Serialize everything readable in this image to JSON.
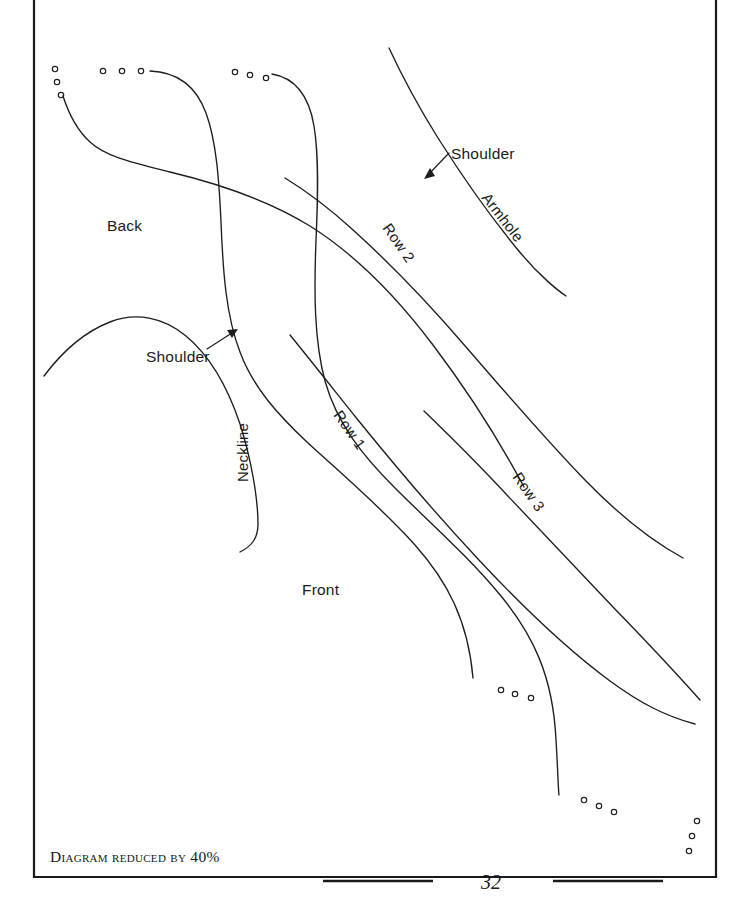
{
  "page": {
    "number": "32",
    "caption": "Diagram reduced by 40%",
    "width": 741,
    "height": 912,
    "background_color": "#ffffff",
    "ink_color": "#1d1d1d",
    "frame": {
      "x": 33,
      "y": -4,
      "width": 684,
      "height": 881,
      "stroke_color": "#1a1a1a"
    }
  },
  "diagram": {
    "title_labels": {
      "back": "Back",
      "front": "Front"
    },
    "annotations": [
      {
        "id": "shoulder-back",
        "text": "Shoulder",
        "x": 146,
        "y": 362,
        "rotation": 0
      },
      {
        "id": "shoulder-front",
        "text": "Shoulder",
        "x": 451,
        "y": 159,
        "rotation": 0
      },
      {
        "id": "neckline",
        "text": "Neckline",
        "x": 248,
        "y": 482,
        "rotation": -90
      },
      {
        "id": "armhole",
        "text": "Armhole",
        "x": 481,
        "y": 198,
        "rotation": 52
      },
      {
        "id": "row-1",
        "text": "Row 1",
        "x": 333,
        "y": 415,
        "rotation": 55
      },
      {
        "id": "row-2",
        "text": "Row 2",
        "x": 382,
        "y": 228,
        "rotation": 55
      },
      {
        "id": "row-3",
        "text": "Row 3",
        "x": 512,
        "y": 477,
        "rotation": 55
      }
    ],
    "region_labels": [
      {
        "id": "back",
        "text": "Back",
        "x": 107,
        "y": 231
      },
      {
        "id": "front",
        "text": "Front",
        "x": 302,
        "y": 595
      }
    ],
    "curves": [
      {
        "id": "back-neck-curve",
        "name": "back-neckline-curve"
      },
      {
        "id": "cable-strand-a",
        "name": "cable-strand-a"
      },
      {
        "id": "cable-strand-b",
        "name": "cable-strand-b"
      },
      {
        "id": "row-1-curve",
        "name": "row-1-curve"
      },
      {
        "id": "row-2-curve",
        "name": "row-2-curve"
      },
      {
        "id": "row-3-curve",
        "name": "row-3-curve"
      },
      {
        "id": "front-shoulder-curve",
        "name": "front-shoulder-curve"
      },
      {
        "id": "armhole-curve",
        "name": "armhole-curve"
      }
    ],
    "stitch_dot_groups": [
      {
        "id": "dots-top-left",
        "count": 3
      },
      {
        "id": "dots-top-mid-left",
        "count": 3
      },
      {
        "id": "dots-top-mid-right",
        "count": 3
      },
      {
        "id": "dots-bottom-mid",
        "count": 3
      },
      {
        "id": "dots-bottom-right-inner",
        "count": 3
      },
      {
        "id": "dots-bottom-right-outer",
        "count": 3
      }
    ]
  }
}
